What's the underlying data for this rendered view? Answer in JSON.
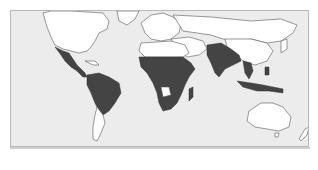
{
  "map": {
    "type": "world-choropleth",
    "colors": {
      "ocean": "#ececec",
      "land_default": "#ffffff",
      "land_highlighted": "#444444",
      "border": "#555555",
      "frame_border": "#b8b8b8"
    },
    "highlighted_regions": [
      "Mexico",
      "Central America",
      "Northern South America",
      "Brazil",
      "Bolivia",
      "Paraguay",
      "Western Africa",
      "Central Africa",
      "East Africa",
      "Southern Africa",
      "Madagascar",
      "India",
      "Pakistan",
      "Bangladesh",
      "Southeast Asia",
      "Indonesia",
      "Papua New Guinea"
    ],
    "label": "World map"
  }
}
